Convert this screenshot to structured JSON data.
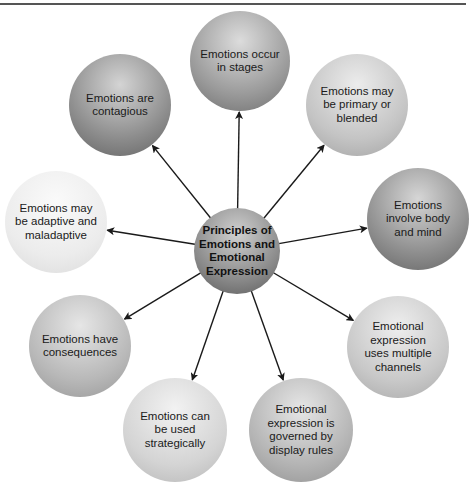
{
  "diagram": {
    "title_fragment": "",
    "center": {
      "label": "Principles of Emotions and Emotional Expression",
      "cx": 237,
      "cy": 251,
      "r": 43,
      "shade": [
        "#d0d0d0",
        "#8a8a8a",
        "#5a5a5a"
      ]
    },
    "nodes": [
      {
        "id": "stages",
        "label": "Emotions occur in stages",
        "cx": 240,
        "cy": 61,
        "r": 50,
        "shade": [
          "#dcdcdc",
          "#9a9a9a",
          "#6e6e6e"
        ]
      },
      {
        "id": "primary-blended",
        "label": "Emotions may be primary or blended",
        "cx": 357,
        "cy": 105,
        "r": 51,
        "shade": [
          "#ececec",
          "#c4c4c4",
          "#a2a2a2"
        ]
      },
      {
        "id": "body-mind",
        "label": "Emotions involve body and mind",
        "cx": 418,
        "cy": 219,
        "r": 51,
        "shade": [
          "#d6d6d6",
          "#8e8e8e",
          "#636363"
        ]
      },
      {
        "id": "multiple-channels",
        "label": "Emotional expression uses multiple channels",
        "cx": 398,
        "cy": 347,
        "r": 51,
        "shade": [
          "#eeeeee",
          "#c8c8c8",
          "#a8a8a8"
        ]
      },
      {
        "id": "display-rules",
        "label": "Emotional expression is governed by display rules",
        "cx": 301,
        "cy": 430,
        "r": 52,
        "shade": [
          "#e6e6e6",
          "#b4b4b4",
          "#929292"
        ]
      },
      {
        "id": "strategically",
        "label": "Emotions can be used strategically",
        "cx": 175,
        "cy": 430,
        "r": 52,
        "shade": [
          "#f2f2f2",
          "#d4d4d4",
          "#b6b6b6"
        ]
      },
      {
        "id": "consequences",
        "label": "Emotions have consequences",
        "cx": 80,
        "cy": 346,
        "r": 51,
        "shade": [
          "#e6e6e6",
          "#b8b8b8",
          "#969696"
        ]
      },
      {
        "id": "adaptive-maladaptive",
        "label": "Emotions may be adaptive and maladaptive",
        "cx": 56,
        "cy": 222,
        "r": 51,
        "shade": [
          "#fafafa",
          "#ececec",
          "#dadada"
        ]
      },
      {
        "id": "contagious",
        "label": "Emotions are contagious",
        "cx": 120,
        "cy": 105,
        "r": 51,
        "shade": [
          "#d4d4d4",
          "#8c8c8c",
          "#626262"
        ]
      }
    ],
    "arrow_color": "#1a1a1a"
  }
}
